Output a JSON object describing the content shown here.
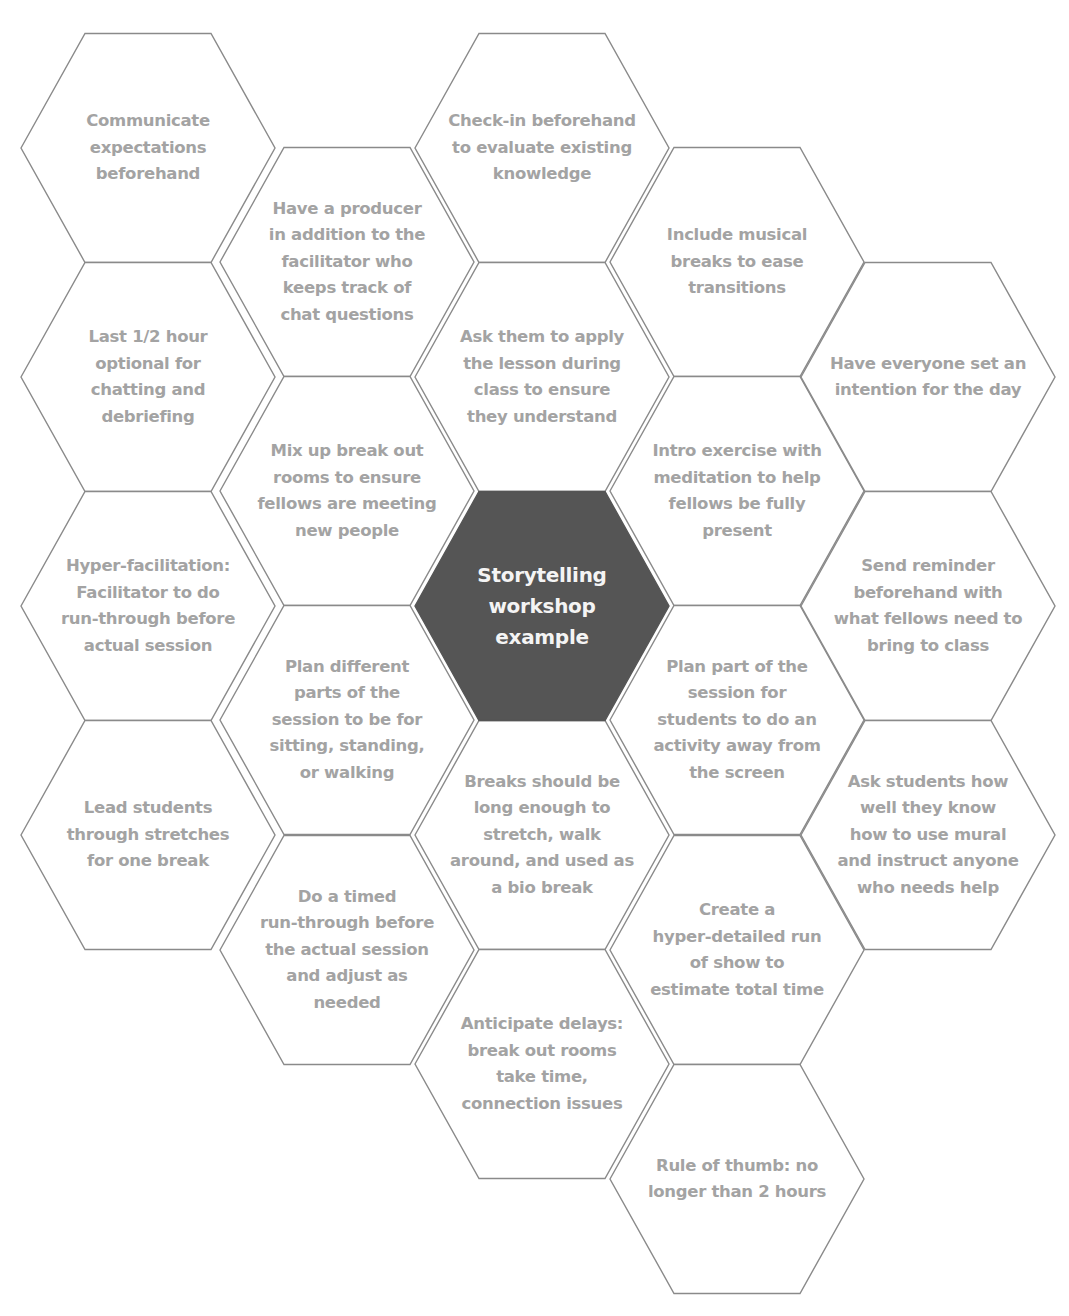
{
  "diagram": {
    "title": "Storytelling workshop example",
    "style": {
      "stroke_color": "#8a8a8a",
      "fill_color": "#ffffff",
      "center_fill_color": "#555555",
      "text_color": "#a3a3a3",
      "center_text_color": "#f4f4f4"
    },
    "center": {
      "label": "Storytelling\nworkshop\nexample",
      "cx": 542,
      "cy": 606
    },
    "cells": [
      {
        "id": "communicate-expectations",
        "label": "Communicate\nexpectations\nbeforehand",
        "cx": 148,
        "cy": 148
      },
      {
        "id": "last-half-hour",
        "label": "Last 1/2 hour\noptional for\nchatting and\ndebriefing",
        "cx": 148,
        "cy": 377
      },
      {
        "id": "hyper-facilitation",
        "label": "Hyper-facilitation:\nFacilitator to do\nrun-through before\nactual session",
        "cx": 148,
        "cy": 606
      },
      {
        "id": "lead-stretches",
        "label": "Lead students\nthrough stretches\nfor one break",
        "cx": 148,
        "cy": 835
      },
      {
        "id": "have-producer",
        "label": "Have a producer\nin addition to the\nfacilitator who\nkeeps track of\nchat questions",
        "cx": 347,
        "cy": 262
      },
      {
        "id": "mix-break-out",
        "label": "Mix up break out\nrooms to ensure\nfellows are meeting\nnew people",
        "cx": 347,
        "cy": 491
      },
      {
        "id": "plan-different-parts",
        "label": "Plan different\nparts of the\nsession to be for\nsitting, standing,\nor walking",
        "cx": 347,
        "cy": 720
      },
      {
        "id": "timed-run-through",
        "label": "Do a timed\nrun-through before\nthe actual session\nand adjust as\nneeded",
        "cx": 347,
        "cy": 950
      },
      {
        "id": "check-in-beforehand",
        "label": "Check-in beforehand\nto evaluate existing\nknowledge",
        "cx": 542,
        "cy": 148
      },
      {
        "id": "apply-lesson",
        "label": "Ask them to apply\nthe lesson during\nclass to ensure\nthey understand",
        "cx": 542,
        "cy": 377
      },
      {
        "id": "breaks-long-enough",
        "label": "Breaks should be\nlong enough to\nstretch, walk\naround, and used as\na bio break",
        "cx": 542,
        "cy": 835
      },
      {
        "id": "anticipate-delays",
        "label": "Anticipate delays:\nbreak out rooms\ntake time,\nconnection issues",
        "cx": 542,
        "cy": 1064
      },
      {
        "id": "musical-breaks",
        "label": "Include musical\nbreaks to ease\ntransitions",
        "cx": 737,
        "cy": 262
      },
      {
        "id": "intro-meditation",
        "label": "Intro exercise with\nmeditation to help\nfellows be fully\npresent",
        "cx": 737,
        "cy": 491
      },
      {
        "id": "activity-away-from-screen",
        "label": "Plan part of the\nsession for\nstudents to do an\nactivity away from\nthe screen",
        "cx": 737,
        "cy": 720
      },
      {
        "id": "hyper-detailed-run-of-show",
        "label": "Create a\nhyper-detailed run\nof show to\nestimate total time",
        "cx": 737,
        "cy": 950
      },
      {
        "id": "rule-of-thumb",
        "label": "Rule of thumb: no\nlonger than 2 hours",
        "cx": 737,
        "cy": 1179
      },
      {
        "id": "set-intention",
        "label": "Have everyone set an\nintention for the day",
        "cx": 928,
        "cy": 377
      },
      {
        "id": "send-reminder",
        "label": "Send reminder\nbeforehand with\nwhat fellows need to\nbring to class",
        "cx": 928,
        "cy": 606
      },
      {
        "id": "ask-mural-knowledge",
        "label": "Ask students how\nwell they know\nhow to use mural\nand instruct anyone\nwho needs help",
        "cx": 928,
        "cy": 835
      }
    ]
  }
}
